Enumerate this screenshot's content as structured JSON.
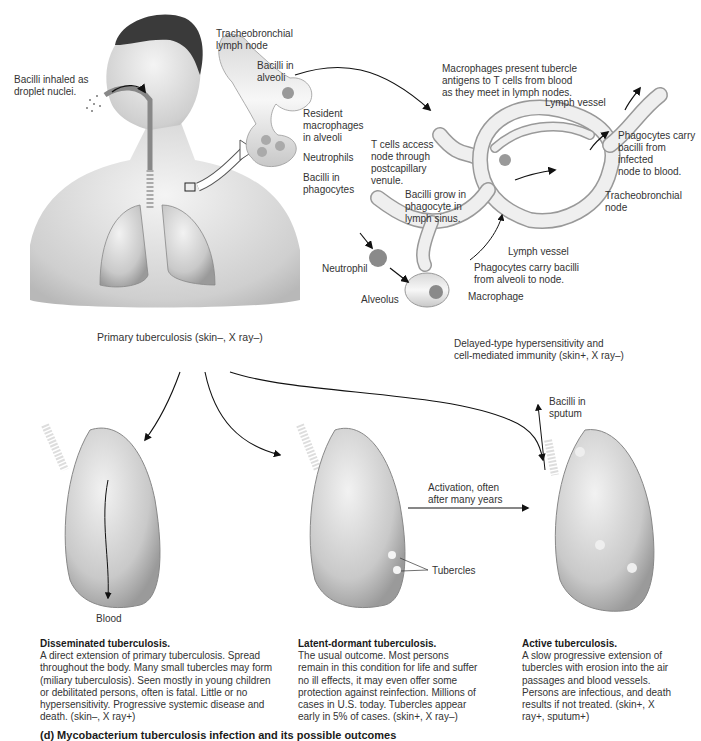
{
  "figure": {
    "domain": "Diagram",
    "primary": {
      "caption": "Primary tuberculosis (skin–, X ray–)",
      "labels": {
        "inhaled": "Bacilli inhaled as\ndroplet nuclei.",
        "tracheobronchial_lymph_node": "Tracheobronchial\nlymph node",
        "bacilli_in_alveoli": "Bacilli in\nalveoli",
        "resident_macrophages": "Resident\nmacrophages\nin alveoli",
        "neutrophils": "Neutrophils",
        "bacilli_in_phagocytes": "Bacilli in\nphagocytes"
      }
    },
    "lymph": {
      "caption": "Delayed-type hypersensitivity and\ncell-mediated immunity (skin+, X ray–)",
      "labels": {
        "macrophages_present": "Macrophages present tubercle\nantigens to T cells from blood\nas they meet in lymph nodes.",
        "lymph_vessel_top": "Lymph vessel",
        "t_cells_access": "T cells access\nnode through\npostcapillary\nvenule.",
        "phagocytes_carry_blood": "Phagocytes carry\nbacilli from\ninfected\nnode to blood.",
        "bacilli_grow": "Bacilli grow in\nphagocyte in\nlymph sinus.",
        "tracheobronchial_node": "Tracheobronchial\nnode",
        "lymph_vessel_bottom": "Lymph vessel",
        "neutrophil": "Neutrophil",
        "phagocytes_carry_node": "Phagocytes carry bacilli\nfrom alveoli to node.",
        "alveolus": "Alveolus",
        "macrophage": "Macrophage"
      }
    },
    "outcomes": [
      {
        "title": "Disseminated tuberculosis.",
        "text": "A direct extension of primary tuberculosis. Spread throughout the body. Many small tubercles may form (miliary tuberculosis). Seen mostly in young children or debilitated persons, often is fatal. Little or no hypersensitivity. Progressive systemic disease and death. (skin–, X ray+)",
        "label": "Blood"
      },
      {
        "title": "Latent-dormant tuberculosis.",
        "text": "The usual outcome. Most persons remain in this condition for life and suffer no ill effects, it may even offer some protection against reinfection. Millions of cases in U.S. today. Tubercles appear early in 5% of cases. (skin+, X ray–)",
        "label": "Tubercles"
      },
      {
        "title": "Active tuberculosis.",
        "text": "A slow progressive extension of tubercles with erosion into the air passages and blood vessels. Persons are infectious, and death results if not treated. (skin+, X ray+, sputum+)",
        "label": "Bacilli in\nsputum"
      }
    ],
    "activation_label": "Activation, often\nafter many years",
    "bottom_caption": "(d) Mycobacterium tuberculosis infection and its possible outcomes"
  }
}
